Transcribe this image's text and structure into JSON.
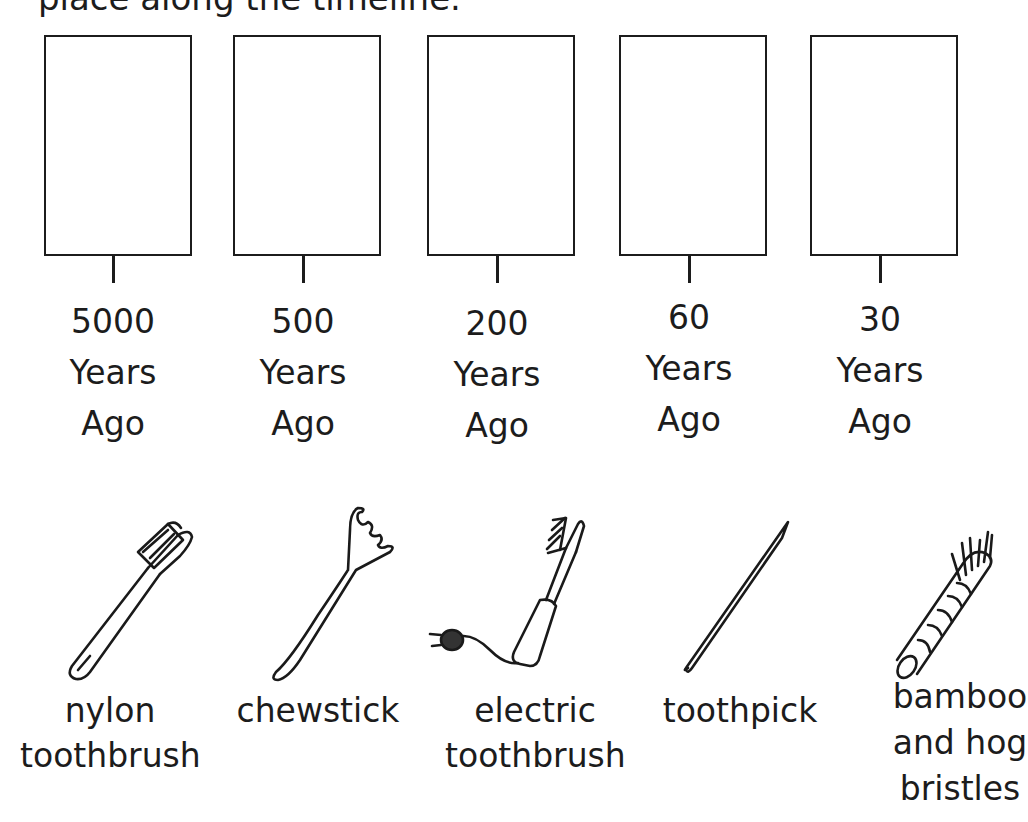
{
  "instructions": {
    "text": "place along the timeline."
  },
  "timeline": {
    "slots": [
      {
        "value": "5000",
        "unit": "Years",
        "suffix": "Ago"
      },
      {
        "value": "500",
        "unit": "Years",
        "suffix": "Ago"
      },
      {
        "value": "200",
        "unit": "Years",
        "suffix": "Ago"
      },
      {
        "value": "60",
        "unit": "Years",
        "suffix": "Ago"
      },
      {
        "value": "30",
        "unit": "Years",
        "suffix": "Ago"
      }
    ]
  },
  "items": [
    {
      "icon": "nylon-toothbrush-icon",
      "line1": "nylon",
      "line2": "toothbrush"
    },
    {
      "icon": "chewstick-icon",
      "line1": "chewstick"
    },
    {
      "icon": "electric-toothbrush-icon",
      "line1": "electric",
      "line2": "toothbrush"
    },
    {
      "icon": "toothpick-icon",
      "line1": "toothpick"
    },
    {
      "icon": "bamboo-brush-icon",
      "line1": "bamboo",
      "line2": "and hog",
      "line3": "bristles"
    }
  ]
}
